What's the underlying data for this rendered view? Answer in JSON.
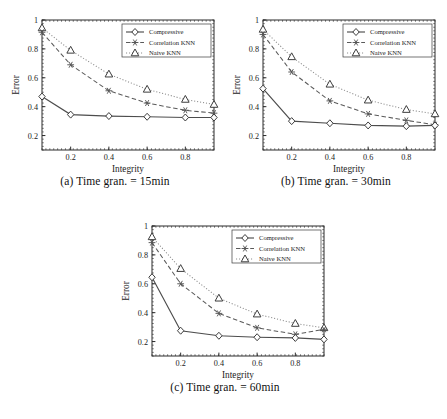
{
  "figure": {
    "panels": [
      {
        "id": "a",
        "caption": "(a) Time gran. = 15min"
      },
      {
        "id": "b",
        "caption": "(b) Time gran. = 30min"
      },
      {
        "id": "c",
        "caption": "(c) Time gran. = 60min"
      }
    ]
  },
  "chart_data": [
    {
      "type": "line",
      "panel": "a",
      "title": "(a) Time gran. = 15min",
      "xlabel": "Integrity",
      "ylabel": "Error",
      "xlim": [
        0.05,
        0.95
      ],
      "ylim": [
        0.1,
        1.0
      ],
      "xticks": [
        0.2,
        0.4,
        0.6,
        0.8
      ],
      "xtick_labels": [
        "0.2",
        "0.4",
        "0.6",
        "0.8"
      ],
      "yticks": [
        0.2,
        0.4,
        0.6,
        0.8,
        1.0
      ],
      "ytick_labels": [
        "0.2",
        "0.4",
        "0.6",
        "0.8",
        "1"
      ],
      "grid": false,
      "legend_position": "upper right",
      "x": [
        0.05,
        0.2,
        0.4,
        0.6,
        0.8,
        0.95
      ],
      "series": [
        {
          "name": "Compressive",
          "marker": "diamond",
          "linestyle": "solid",
          "values": [
            0.47,
            0.345,
            0.335,
            0.33,
            0.325,
            0.325
          ]
        },
        {
          "name": "Correlation KNN",
          "marker": "star",
          "linestyle": "dashed",
          "values": [
            0.915,
            0.69,
            0.51,
            0.425,
            0.375,
            0.355
          ]
        },
        {
          "name": "Naive KNN",
          "marker": "triangle",
          "linestyle": "dotted",
          "values": [
            0.945,
            0.79,
            0.625,
            0.52,
            0.45,
            0.415
          ]
        }
      ]
    },
    {
      "type": "line",
      "panel": "b",
      "title": "(b) Time gran. = 30min",
      "xlabel": "Integrity",
      "ylabel": "Error",
      "xlim": [
        0.05,
        0.95
      ],
      "ylim": [
        0.1,
        1.0
      ],
      "xticks": [
        0.2,
        0.4,
        0.6,
        0.8
      ],
      "xtick_labels": [
        "0.2",
        "0.4",
        "0.6",
        "0.8"
      ],
      "yticks": [
        0.2,
        0.4,
        0.6,
        0.8,
        1.0
      ],
      "ytick_labels": [
        "0.2",
        "0.4",
        "0.6",
        "0.8",
        "1"
      ],
      "grid": false,
      "legend_position": "upper right",
      "x": [
        0.05,
        0.2,
        0.4,
        0.6,
        0.8,
        0.95
      ],
      "series": [
        {
          "name": "Compressive",
          "marker": "diamond",
          "linestyle": "solid",
          "values": [
            0.525,
            0.3,
            0.285,
            0.27,
            0.265,
            0.27
          ]
        },
        {
          "name": "Correlation KNN",
          "marker": "star",
          "linestyle": "dashed",
          "values": [
            0.9,
            0.64,
            0.44,
            0.35,
            0.305,
            0.275
          ]
        },
        {
          "name": "Naive KNN",
          "marker": "triangle",
          "linestyle": "dotted",
          "values": [
            0.935,
            0.745,
            0.555,
            0.445,
            0.38,
            0.35
          ]
        }
      ]
    },
    {
      "type": "line",
      "panel": "c",
      "title": "(c) Time gran. = 60min",
      "xlabel": "Integrity",
      "ylabel": "Error",
      "xlim": [
        0.05,
        0.95
      ],
      "ylim": [
        0.1,
        1.0
      ],
      "xticks": [
        0.2,
        0.4,
        0.6,
        0.8
      ],
      "xtick_labels": [
        "0.2",
        "0.4",
        "0.6",
        "0.8"
      ],
      "yticks": [
        0.2,
        0.4,
        0.6,
        0.8,
        1.0
      ],
      "ytick_labels": [
        "0.2",
        "0.4",
        "0.6",
        "0.8",
        "1"
      ],
      "grid": false,
      "legend_position": "upper right",
      "x": [
        0.05,
        0.2,
        0.4,
        0.6,
        0.8,
        0.95
      ],
      "series": [
        {
          "name": "Compressive",
          "marker": "diamond",
          "linestyle": "solid",
          "values": [
            0.645,
            0.275,
            0.24,
            0.23,
            0.225,
            0.215
          ]
        },
        {
          "name": "Correlation KNN",
          "marker": "star",
          "linestyle": "dashed",
          "values": [
            0.885,
            0.6,
            0.395,
            0.295,
            0.25,
            0.285
          ]
        },
        {
          "name": "Naive KNN",
          "marker": "triangle",
          "linestyle": "dotted",
          "values": [
            0.925,
            0.705,
            0.5,
            0.39,
            0.325,
            0.295
          ]
        }
      ]
    }
  ]
}
